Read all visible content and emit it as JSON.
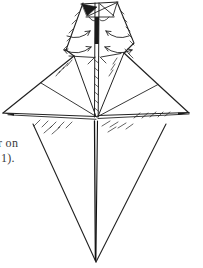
{
  "page": {
    "background_color": "#ffffff",
    "ink_color": "#222222",
    "text_fragments": {
      "line1": "r on",
      "line2": "1)."
    },
    "figure": {
      "name": "origami-step-diagram",
      "description": "Hand-drawn origami diagram: narrow hatched head with curved fold arrows, central spine, two spread wing flaps with creases and hatched shading, and a long lower triangular point."
    }
  }
}
